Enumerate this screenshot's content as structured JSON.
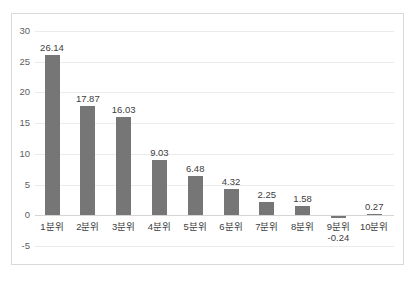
{
  "chart_data": {
    "type": "bar",
    "title": "",
    "xlabel": "",
    "ylabel": "",
    "categories": [
      "1분위",
      "2분위",
      "3분위",
      "4분위",
      "5분위",
      "6분위",
      "7분위",
      "8분위",
      "9분위",
      "10분위"
    ],
    "values": [
      26.14,
      17.87,
      16.03,
      9.03,
      6.48,
      4.32,
      2.25,
      1.58,
      -0.24,
      0.27
    ],
    "value_labels": [
      "26.14",
      "17.87",
      "16.03",
      "9.03",
      "6.48",
      "4.32",
      "2.25",
      "1.58",
      "-0.24",
      "0.27"
    ],
    "ylim": [
      -5,
      30
    ],
    "ytick_values": [
      30,
      25,
      20,
      15,
      10,
      5,
      0,
      -5
    ],
    "ytick_labels": [
      "30",
      "25",
      "20",
      "15",
      "10",
      "5",
      "0",
      "-5"
    ],
    "grid": true,
    "legend": "none",
    "bar_color": "#767676",
    "gridline_color": "#ebebeb",
    "axis_text_color": "#404040",
    "ytick_text_color": "#606060",
    "border_color": "#d9d9d9",
    "background_color": "#ffffff",
    "negative_label_below_category": true
  }
}
